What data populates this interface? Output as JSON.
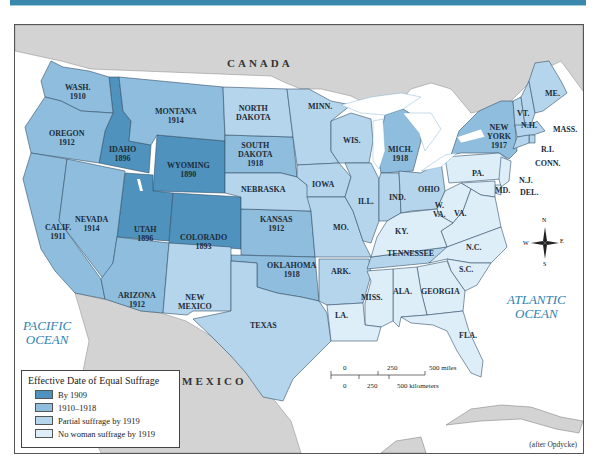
{
  "colors": {
    "by_1909": "#4e92bd",
    "y1910_1918": "#8ebddd",
    "partial_1919": "#b4d5ec",
    "none_1919": "#ddeef8",
    "foreign_land": "#d3d3d3",
    "water": "#ffffff",
    "accent_bar": "#3b88ad",
    "ocean_label": "#2f82b3"
  },
  "countries": {
    "canada": "CANADA",
    "mexico": "MEXICO"
  },
  "oceans": {
    "pacific": "PACIFIC\nOCEAN",
    "atlantic": "ATLANTIC\nOCEAN"
  },
  "states": {
    "wash": "WASH.\n1910",
    "oregon": "OREGON\n1912",
    "calif": "CALIF.\n1911",
    "idaho": "IDAHO\n1896",
    "nevada": "NEVADA\n1914",
    "montana": "MONTANA\n1914",
    "wyoming": "WYOMING\n1890",
    "utah": "UTAH\n1896",
    "colorado": "COLORADO\n1893",
    "arizona": "ARIZONA\n1912",
    "new_mexico": "NEW\nMEXICO",
    "north_dakota": "NORTH\nDAKOTA",
    "south_dakota": "SOUTH\nDAKOTA\n1918",
    "nebraska": "NEBRASKA",
    "kansas": "KANSAS\n1912",
    "oklahoma": "OKLAHOMA\n1918",
    "texas": "TEXAS",
    "minn": "MINN.",
    "iowa": "IOWA",
    "mo": "MO.",
    "ark": "ARK.",
    "la": "LA.",
    "wis": "WIS.",
    "ill": "ILL.",
    "mich": "MICH.\n1918",
    "ind": "IND.",
    "ohio": "OHIO",
    "ky": "KY.",
    "tennessee": "TENNESSEE",
    "miss": "MISS.",
    "ala": "ALA.",
    "georgia": "GEORGIA",
    "fla": "FLA.",
    "sc": "S.C.",
    "nc": "N.C.",
    "va": "VA.",
    "wva": "W.\nVA.",
    "pa": "PA.",
    "md": "MD.",
    "del": "DEL.",
    "nj": "N.J.",
    "new_york": "NEW\nYORK\n1917",
    "conn": "CONN.",
    "ri": "R.I.",
    "mass": "MASS.",
    "vt": "VT.",
    "nh": "N.H.",
    "me": "ME."
  },
  "legend": {
    "title": "Effective Date of Equal Suffrage",
    "items": [
      {
        "label": "By 1909",
        "color": "#4e92bd"
      },
      {
        "label": "1910–1918",
        "color": "#8ebddd"
      },
      {
        "label": "Partial suffrage by 1919",
        "color": "#b4d5ec"
      },
      {
        "label": "No woman suffrage by 1919",
        "color": "#ddeef8"
      }
    ]
  },
  "scale": {
    "miles": [
      "0",
      "250",
      "500 miles"
    ],
    "km": [
      "0",
      "250",
      "500 kilometers"
    ]
  },
  "compass": {
    "n": "N",
    "s": "S",
    "e": "E",
    "w": "W"
  },
  "credit": "(after Opdycke)"
}
